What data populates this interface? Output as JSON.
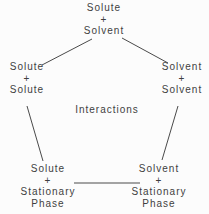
{
  "diagram": {
    "center_label": "Interactions",
    "nodes": {
      "top": {
        "lines": [
          "Solute",
          "+",
          "Solvent"
        ]
      },
      "left": {
        "lines": [
          "Solute",
          "+",
          "Solute"
        ]
      },
      "right": {
        "lines": [
          "Solvent",
          "+",
          "Solvent"
        ]
      },
      "bottom_left": {
        "lines": [
          "Solute",
          "+",
          "Stationary",
          "Phase"
        ]
      },
      "bottom_right": {
        "lines": [
          "Solvent",
          "+",
          "Stationary",
          "Phase"
        ]
      }
    },
    "colors": {
      "text": "#3f3f3f",
      "line": "#4a4a4a",
      "background": "#fcfcfc"
    }
  }
}
